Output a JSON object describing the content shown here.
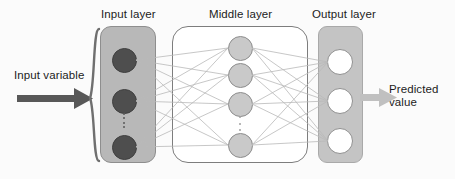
{
  "diagram": {
    "colors": {
      "input_box_fill": "#b8b8b8",
      "middle_box_fill": "#ffffff",
      "output_box_fill": "#c4c4c4",
      "input_node_fill": "#4e4e4e",
      "middle_node_fill": "#c9c9c9",
      "output_node_fill": "#ffffff",
      "edge_stroke": "#b0b0b0",
      "input_arrow": "#585858",
      "output_arrow": "#bdbdbd",
      "text": "#1b1b1b"
    },
    "labels": {
      "input_layer": "Input layer",
      "middle_layer": "Middle layer",
      "output_layer": "Output layer",
      "input_variable": "Input variable",
      "predicted_value_line1": "Predicted",
      "predicted_value_line2": "value"
    },
    "layers": {
      "input": {
        "name": "Input layer",
        "node_count_shown": 3,
        "ellipsis": true,
        "node_style": "filled-dark"
      },
      "middle": {
        "name": "Middle layer",
        "node_count_shown": 4,
        "ellipsis": true,
        "node_style": "filled-gray"
      },
      "output": {
        "name": "Output layer",
        "node_count_shown": 3,
        "ellipsis": false,
        "node_style": "outlined-white"
      }
    },
    "icons": {
      "input_arrow": "right-arrow-icon",
      "output_arrow": "right-arrow-icon",
      "brace": "left-curly-brace-icon",
      "input_ellipsis": "vertical-ellipsis-icon",
      "middle_ellipsis": "vertical-ellipsis-icon"
    }
  }
}
